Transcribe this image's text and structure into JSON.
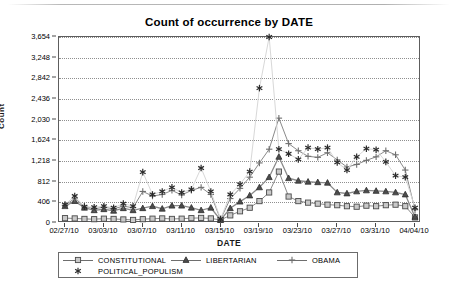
{
  "chart_data": {
    "type": "line",
    "title": "Count of occurrence by DATE",
    "xlabel": "DATE",
    "ylabel": "Count",
    "grid": true,
    "legend_position": "bottom-left",
    "ylim": [
      0,
      3654
    ],
    "ytick_labels": [
      "0",
      "406",
      "812",
      "1,218",
      "1,624",
      "2,030",
      "2,436",
      "2,842",
      "3,248",
      "3,654"
    ],
    "ytick_values": [
      0,
      406,
      812,
      1218,
      1624,
      2030,
      2436,
      2842,
      3248,
      3654
    ],
    "xtick_labels": [
      "02/27/10",
      "03/03/10",
      "03/07/10",
      "03/11/10",
      "03/15/10",
      "03/19/10",
      "03/23/10",
      "03/27/10",
      "03/31/10",
      "04/04/10"
    ],
    "x": [
      "02/27/10",
      "02/28/10",
      "03/01/10",
      "03/02/10",
      "03/03/10",
      "03/04/10",
      "03/05/10",
      "03/06/10",
      "03/07/10",
      "03/08/10",
      "03/09/10",
      "03/10/10",
      "03/11/10",
      "03/12/10",
      "03/13/10",
      "03/14/10",
      "03/15/10",
      "03/16/10",
      "03/17/10",
      "03/18/10",
      "03/19/10",
      "03/20/10",
      "03/21/10",
      "03/22/10",
      "03/23/10",
      "03/24/10",
      "03/25/10",
      "03/26/10",
      "03/27/10",
      "03/28/10",
      "03/29/10",
      "03/30/10",
      "03/31/10",
      "04/01/10",
      "04/02/10",
      "04/03/10",
      "04/04/10"
    ],
    "series": [
      {
        "name": "CONSTITUTIONAL",
        "marker": "square",
        "color": "#7a7a7a",
        "values": [
          95,
          90,
          80,
          75,
          85,
          80,
          70,
          60,
          75,
          85,
          90,
          80,
          85,
          95,
          100,
          90,
          60,
          150,
          230,
          300,
          430,
          600,
          1010,
          520,
          430,
          400,
          380,
          360,
          350,
          330,
          320,
          340,
          330,
          350,
          360,
          330,
          110
        ]
      },
      {
        "name": "LIBERTARIAN",
        "marker": "triangle",
        "color": "#555555",
        "values": [
          330,
          430,
          300,
          250,
          270,
          240,
          290,
          250,
          290,
          330,
          280,
          340,
          340,
          300,
          250,
          300,
          60,
          290,
          420,
          540,
          700,
          900,
          1300,
          880,
          830,
          810,
          800,
          790,
          600,
          580,
          620,
          640,
          630,
          620,
          600,
          560,
          120
        ]
      },
      {
        "name": "OBAMA",
        "marker": "plus",
        "color": "#6f6f6f",
        "values": [
          350,
          480,
          330,
          280,
          310,
          280,
          330,
          300,
          620,
          530,
          560,
          640,
          550,
          640,
          700,
          560,
          70,
          480,
          680,
          900,
          1180,
          1450,
          2060,
          1560,
          1420,
          1310,
          1290,
          1380,
          1240,
          1100,
          1150,
          1230,
          1300,
          1420,
          1340,
          1040,
          260
        ]
      },
      {
        "name": "POLITICAL_POPULISM",
        "marker": "asterisk",
        "color": "#2a2a2a",
        "values": [
          360,
          530,
          320,
          310,
          330,
          300,
          380,
          330,
          1000,
          560,
          620,
          700,
          600,
          660,
          1080,
          620,
          80,
          560,
          760,
          1010,
          2650,
          3654,
          1450,
          1360,
          1250,
          1480,
          1450,
          1480,
          1190,
          1040,
          1300,
          1460,
          1440,
          1200,
          930,
          900,
          300
        ]
      }
    ]
  },
  "legend": {
    "entries": [
      {
        "label": "CONSTITUTIONAL"
      },
      {
        "label": "LIBERTARIAN"
      },
      {
        "label": "OBAMA"
      },
      {
        "label": "POLITICAL_POPULISM"
      }
    ]
  }
}
